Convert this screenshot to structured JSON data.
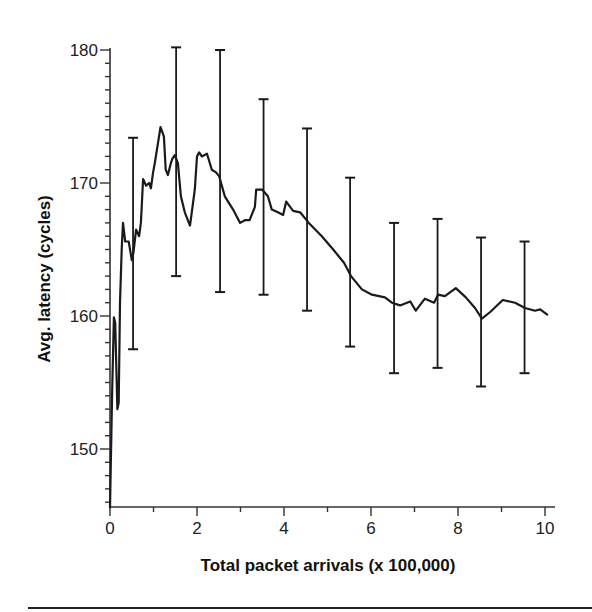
{
  "chart_data": {
    "type": "line",
    "title": "",
    "xlabel": "Total packet arrivals (x 100,000)",
    "ylabel": "Avg. latency (cycles)",
    "xlim": [
      0,
      10
    ],
    "ylim": [
      145.5,
      180
    ],
    "x_ticks": [
      0,
      2,
      4,
      6,
      8,
      10
    ],
    "x_minor_ticks": [
      1,
      3,
      5,
      7,
      9
    ],
    "y_ticks": [
      150,
      160,
      170,
      180
    ],
    "y_minor_step": 1,
    "grid": false,
    "legend": null,
    "series": [
      {
        "name": "Avg. latency",
        "color": "#1a1a1a",
        "x": [
          0.0,
          0.05,
          0.09,
          0.12,
          0.17,
          0.2,
          0.23,
          0.27,
          0.3,
          0.35,
          0.43,
          0.5,
          0.54,
          0.6,
          0.67,
          0.71,
          0.76,
          0.83,
          0.9,
          0.94,
          0.99,
          1.03,
          1.16,
          1.24,
          1.28,
          1.33,
          1.4,
          1.43,
          1.47,
          1.49,
          1.56,
          1.63,
          1.72,
          1.84,
          1.95,
          2.0,
          2.05,
          2.11,
          2.23,
          2.34,
          2.44,
          2.51,
          2.64,
          2.83,
          2.99,
          3.1,
          3.21,
          3.33,
          3.36,
          3.5,
          3.63,
          3.72,
          3.86,
          3.98,
          4.05,
          4.21,
          4.37,
          4.57,
          4.87,
          5.13,
          5.38,
          5.54,
          5.79,
          6.02,
          6.32,
          6.48,
          6.67,
          6.9,
          7.03,
          7.24,
          7.45,
          7.54,
          7.7,
          7.95,
          8.18,
          8.39,
          8.55,
          8.74,
          9.03,
          9.31,
          9.54,
          9.77,
          9.89,
          10.05
        ],
        "y": [
          145.6,
          154.5,
          159.9,
          159.5,
          153.0,
          153.5,
          161.0,
          165.0,
          167.0,
          165.6,
          165.6,
          164.2,
          164.8,
          166.5,
          166.0,
          167.0,
          170.3,
          169.8,
          170.0,
          169.6,
          170.8,
          171.5,
          174.2,
          173.5,
          171.0,
          170.6,
          171.5,
          171.8,
          172.0,
          172.1,
          171.5,
          169.0,
          167.8,
          166.8,
          169.5,
          172.0,
          172.3,
          172.0,
          172.2,
          171.0,
          170.8,
          170.5,
          169.0,
          168.0,
          167.0,
          167.2,
          167.2,
          168.2,
          169.5,
          169.5,
          169.0,
          168.0,
          167.8,
          167.6,
          168.6,
          167.9,
          167.8,
          167.0,
          166.0,
          165.0,
          164.0,
          163.0,
          162.0,
          161.6,
          161.4,
          161.0,
          160.8,
          161.1,
          160.4,
          161.3,
          161.0,
          161.6,
          161.5,
          162.1,
          161.4,
          160.6,
          159.8,
          160.3,
          161.2,
          161.0,
          160.6,
          160.4,
          160.5,
          160.1
        ]
      }
    ],
    "error_bars": {
      "x": [
        0.53,
        1.52,
        2.53,
        3.53,
        4.53,
        5.52,
        6.53,
        7.53,
        8.53,
        9.53
      ],
      "upper": [
        173.4,
        180.2,
        180.0,
        176.3,
        174.1,
        170.4,
        167.0,
        167.3,
        165.9,
        165.6
      ],
      "lower": [
        157.5,
        163.0,
        161.8,
        161.6,
        160.4,
        157.7,
        155.7,
        156.1,
        154.7,
        155.7
      ],
      "color": "#1a1a1a"
    }
  },
  "axis": {
    "x_tick_labels": [
      "0",
      "2",
      "4",
      "6",
      "8",
      "10"
    ],
    "y_tick_labels": [
      "150",
      "160",
      "170",
      "180"
    ]
  },
  "colors": {
    "line": "#1a1a1a",
    "axis": "#333333",
    "background": "#ffffff"
  }
}
